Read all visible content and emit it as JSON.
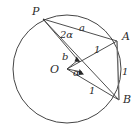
{
  "figure": {
    "name": "inscribed-angle-circle-diagram",
    "type": "geometry-diagram",
    "stroke_color": "#3a3a3a",
    "label_color": "#2b2b2b",
    "background": "#ffffff",
    "width": 139,
    "height": 136
  },
  "circle": {
    "center_label": "O",
    "cx": 67,
    "cy": 69,
    "r": 54
  },
  "points": [
    {
      "id": "P",
      "label": "P",
      "x": 43,
      "y": 19,
      "label_x": 32,
      "label_y": 6
    },
    {
      "id": "A",
      "label": "A",
      "x": 117,
      "y": 41,
      "label_x": 122,
      "label_y": 31
    },
    {
      "id": "B",
      "label": "B",
      "x": 119,
      "y": 100,
      "label_x": 123,
      "label_y": 94
    },
    {
      "id": "O",
      "label": "O",
      "x": 67,
      "y": 69,
      "label_x": 50,
      "label_y": 64
    }
  ],
  "segments": [
    {
      "name": "chord-PA",
      "from": "P",
      "to": "A",
      "label": "a"
    },
    {
      "name": "chord-PB",
      "from": "P",
      "to": "B",
      "label": ""
    },
    {
      "name": "segment-PO",
      "from": "P",
      "to": "O",
      "label": "b"
    },
    {
      "name": "radius-OA",
      "from": "O",
      "to": "A",
      "label": "1"
    },
    {
      "name": "radius-OB",
      "from": "O",
      "to": "B",
      "label": "1"
    },
    {
      "name": "chord-AB",
      "from": "A",
      "to": "B",
      "label": "1"
    }
  ],
  "measures": [
    {
      "name": "chord-PA-length",
      "label": "a",
      "x": 79,
      "y": 23
    },
    {
      "name": "segment-PO-length",
      "label": "b",
      "x": 62,
      "y": 52
    },
    {
      "name": "radius-OA-length",
      "label": "1",
      "x": 94,
      "y": 45
    },
    {
      "name": "radius-OB-length",
      "label": "1",
      "x": 89,
      "y": 86
    },
    {
      "name": "chord-AB-length",
      "label": "1",
      "x": 122,
      "y": 67
    }
  ],
  "angles": [
    {
      "name": "inscribed-angle-at-P",
      "label": "2α",
      "x": 60,
      "y": 30,
      "vertex": "P"
    },
    {
      "name": "central-angle-at-O",
      "label": "α",
      "x": 73,
      "y": 68,
      "vertex": "O"
    }
  ]
}
